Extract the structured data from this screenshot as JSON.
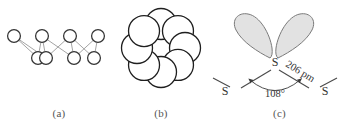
{
  "figure": {
    "kind": "chemistry-structure-figure",
    "background_color": "#ffffff",
    "panels": [
      {
        "id": "a",
        "caption": "(a)",
        "description": "zigzag chain of sulfur atoms drawn as open circles",
        "atom_symbol": "",
        "atom_count": 8,
        "circle_stroke": "#333333",
        "circle_fill": "#ffffff",
        "bond_stroke": "#9a9a9a",
        "atoms": [
          {
            "x": 14,
            "y": 36,
            "r": 6.4,
            "row": "top"
          },
          {
            "x": 38,
            "y": 58,
            "r": 6.4,
            "row": "bottom"
          },
          {
            "x": 42,
            "y": 36,
            "r": 6.4,
            "row": "top"
          },
          {
            "x": 46,
            "y": 58,
            "r": 6.4,
            "row": "bottom"
          },
          {
            "x": 70,
            "y": 36,
            "r": 6.4,
            "row": "top"
          },
          {
            "x": 74,
            "y": 58,
            "r": 6.4,
            "row": "bottom"
          },
          {
            "x": 98,
            "y": 36,
            "r": 6.4,
            "row": "top"
          },
          {
            "x": 94,
            "y": 58,
            "r": 6.4,
            "row": "bottom"
          }
        ],
        "bonds": [
          [
            0,
            1
          ],
          [
            0,
            3
          ],
          [
            1,
            2
          ],
          [
            2,
            3
          ],
          [
            2,
            5
          ],
          [
            3,
            4
          ],
          [
            4,
            5
          ],
          [
            4,
            7
          ],
          [
            5,
            6
          ],
          [
            6,
            7
          ]
        ]
      },
      {
        "id": "b",
        "caption": "(b)",
        "description": "crown ring of eight sulfur atoms viewed from above, space-filling circles",
        "atom_count": 8,
        "circle_stroke": "#1f1f1f",
        "circle_fill": "#ffffff",
        "ring_center_x": 49,
        "ring_center_y": 48,
        "ring_radius": 24,
        "atom_radius": 15.5,
        "start_angle_deg": -90
      },
      {
        "id": "c",
        "caption": "(c)",
        "description": "bond geometry at a sulfur atom showing two lone pairs, bond angle and bond length",
        "center_label": "S",
        "left_label": "S",
        "right_label": "S",
        "angle_label": "108°",
        "length_label": "206 pm",
        "lobe_fill": "#e2e2e2",
        "lobe_stroke": "#7a7a7a",
        "bond_stroke": "#4a4a4a",
        "label_color": "#333333",
        "lone_pair_count": 2
      }
    ]
  },
  "chart_data": {
    "type": "diagram",
    "title": "",
    "subtitle": "",
    "panels": [
      {
        "label": "(a)",
        "type": "ball-and-stick-chain",
        "nodes": 8,
        "edges": 10,
        "note": "zigzag S8 chain projection, open circles"
      },
      {
        "label": "(b)",
        "type": "space-filling-ring",
        "nodes": 8,
        "note": "S8 crown ring top view, eight overlapping circles around hollow center"
      },
      {
        "label": "(c)",
        "type": "bond-geometry",
        "annotations": [
          {
            "name": "bond-angle",
            "value": 108,
            "unit": "degree",
            "text": "108°"
          },
          {
            "name": "bond-length",
            "value": 206,
            "unit": "pm",
            "text": "206 pm"
          }
        ],
        "atom_labels": [
          "S",
          "S",
          "S"
        ],
        "lone_pairs": 2
      }
    ]
  }
}
